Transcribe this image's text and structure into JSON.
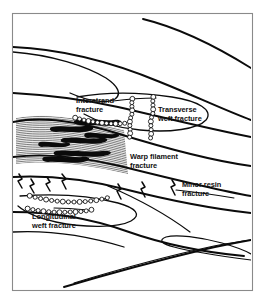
{
  "figure": {
    "background_color": "#ffffff",
    "frame_color": "#8a8a8a",
    "ink_color": "#0b0b0b",
    "frame": {
      "x": 12,
      "y": 13,
      "width": 240,
      "height": 277
    }
  },
  "labels": [
    {
      "id": "interstrand",
      "name": "interstrand-fracture-label",
      "line1": "Interstrand",
      "line2": "fracture",
      "x": 76,
      "y": 103,
      "anchor": "start"
    },
    {
      "id": "transverse_weft",
      "name": "transverse-weft-fracture-label",
      "line1": "Transverse",
      "line2": "weft fracture",
      "x": 158,
      "y": 112,
      "anchor": "start"
    },
    {
      "id": "warp_filament",
      "name": "warp-filament-fracture-label",
      "line1": "Warp filament",
      "line2": "fracture",
      "x": 130,
      "y": 159,
      "anchor": "start"
    },
    {
      "id": "minor_resin",
      "name": "minor-resin-fracture-label",
      "line1": "Minor resin",
      "line2": "fracture",
      "x": 182,
      "y": 187,
      "anchor": "start"
    },
    {
      "id": "longitudinal_weft",
      "name": "longitudinal-weft-fracture-label",
      "line1": "Longitudinal",
      "line2": "weft fracture",
      "x": 32,
      "y": 219,
      "anchor": "start"
    }
  ],
  "chart_data": {
    "type": "diagram",
    "fracture_modes": [
      "Interstrand fracture",
      "Transverse weft fracture",
      "Warp filament fracture",
      "Minor resin fracture",
      "Longitudinal weft fracture"
    ],
    "elements": {
      "tow_boundary_curves": 14,
      "bead_fracture_chains": 4,
      "resin_crack_zigzags": 6,
      "hatched_warp_band": 1
    }
  },
  "geometry": {
    "tow_curves": [
      "M 143 19 C 180 28 214 45 251 68",
      "M 13 47 C 60 49 112 62 160 82 C 195 96 224 110 251 120",
      "M 13 52 C 52 55 86 66 106 78 C 118 86 122 94 115 99 C 107 104 88 101 70 93",
      "M 13 93 C 48 95 82 99 118 107 C 170 119 214 130 251 137",
      "M 77 97 C 105 92 140 92 172 97 C 198 101 214 110 206 120 C 198 129 170 133 140 130 C 118 128 98 122 84 114",
      "M 13 122 C 42 116 80 122 116 133 C 158 146 206 160 251 166",
      "M 13 157 C 44 153 82 157 120 166 C 168 178 216 190 251 196",
      "M 13 177 C 48 175 88 180 124 189 C 168 200 214 209 251 213",
      "M 20 196 C 58 193 92 196 118 203 C 136 208 142 215 131 221 C 118 228 84 228 56 222 C 38 218 25 212 18 206",
      "M 108 186 C 136 198 166 214 190 232",
      "M 13 212 C 52 212 92 219 126 231 C 160 243 200 252 244 256",
      "M 13 232 C 50 230 88 236 124 247",
      "M 64 287 C 108 274 160 260 206 249 C 224 245 240 242 251 240",
      "M 74 283 C 120 269 172 255 214 246 C 230 243 243 241 251 240",
      "M 251 260 C 220 256 192 252 174 247 C 162 244 158 240 166 237 C 176 234 200 237 222 243 C 236 247 246 251 251 254"
    ],
    "leader_lines": [
      "M 113 101 C 128 99 142 98 156 98",
      "M 176 190 C 196 192 216 195 234 198",
      "M 54 208 C 66 208 78 209 88 210"
    ],
    "bead_chains": [
      {
        "name": "transverse-weft-bead-chain-left",
        "path": "M 133 97 C 130 104 134 110 131 117 C 128 124 132 131 129 139",
        "beads": 11
      },
      {
        "name": "transverse-weft-bead-chain-right",
        "path": "M 154 95 C 151 102 155 109 152 116 C 149 124 153 131 150 140",
        "beads": 11
      },
      {
        "name": "interstrand-bead-chain",
        "path": "M 73 117 C 82 120 92 122 103 123 C 112 124 120 124 127 123",
        "beads": 12
      },
      {
        "name": "longitudinal-weft-bead-chain",
        "path": "M 27 195 C 40 199 56 202 74 202 C 88 202 100 200 110 197",
        "beads": 15
      },
      {
        "name": "longitudinal-weft-bead-chain-lower",
        "path": "M 25 208 C 38 211 54 213 70 212 C 80 212 88 211 94 209",
        "beads": 13
      }
    ],
    "resin_cracks": [
      "M 19 174 L 22 179 L 18 181 L 22 188",
      "M 31 179 L 34 184 L 30 186 L 34 193",
      "M 47 177 L 50 182 L 46 184 L 50 191",
      "M 62 174 L 66 179 L 62 181 L 66 189",
      "M 118 184 L 121 189 L 117 191 L 121 199",
      "M 142 182 L 145 187 L 141 189 L 145 197",
      "M 172 180 L 175 185 L 171 187 L 175 195"
    ],
    "hatch_band": {
      "name": "warp-filament-hatched-band",
      "top_path": "M 16 118 C 46 112 82 118 124 130",
      "bottom_path": "M 16 164 C 48 160 86 164 128 174",
      "line_count": 26
    },
    "blotches": [
      "M 52 127 C 62 125 74 128 84 126 C 90 125 96 127 92 130 C 84 134 68 131 56 132 C 50 132 48 128 52 127",
      "M 64 138 C 76 136 88 140 100 138 C 106 137 110 140 105 142 C 95 146 78 142 66 143 C 60 143 59 139 64 138",
      "M 40 142 C 50 141 58 144 66 143 C 70 142 72 145 68 146 C 60 149 48 146 42 147 C 38 147 37 143 40 142",
      "M 56 151 C 70 149 86 153 102 151 C 110 150 114 153 108 155 C 96 159 74 155 60 156 C 53 156 52 152 56 151",
      "M 76 120 C 88 118 102 121 114 120 C 120 119 124 122 119 124 C 110 128 92 124 80 125 C 74 125 72 121 76 120",
      "M 86 133 C 96 132 106 135 114 134 C 119 133 121 136 117 137 C 110 140 96 137 88 138 C 84 138 83 134 86 133",
      "M 44 157 C 56 155 70 159 82 157 C 88 156 92 159 87 161 C 77 165 60 161 48 162 C 42 162 41 158 44 157"
    ]
  }
}
